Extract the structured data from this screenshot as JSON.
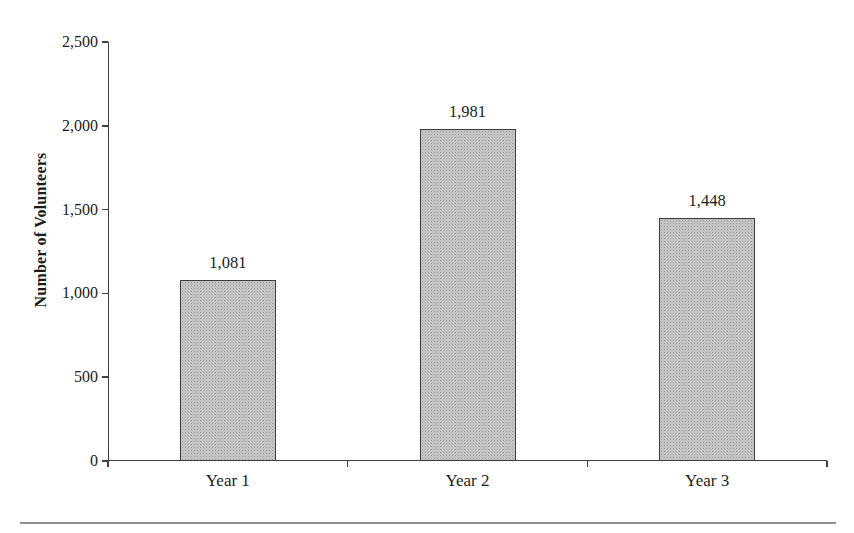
{
  "chart_data": {
    "type": "bar",
    "title": "",
    "categories": [
      "Year 1",
      "Year 2",
      "Year 3"
    ],
    "values": [
      1081,
      1981,
      1448
    ],
    "value_labels": [
      "1,081",
      "1,981",
      "1,448"
    ],
    "xlabel": "",
    "ylabel": "Number of Volunteers",
    "ylim": [
      0,
      2500
    ],
    "ytick_step": 500,
    "ytick_values": [
      0,
      500,
      1000,
      1500,
      2000,
      2500
    ],
    "ytick_labels": [
      "0",
      "500",
      "1,000",
      "1,500",
      "2,000",
      "2,500"
    ],
    "grid": false,
    "legend": false,
    "bar_fill_color": "#c6c6c6",
    "bar_dot_color": "#9a9a9a",
    "bar_border_color": "#3d3d3d",
    "axis_color": "#404040",
    "text_color": "#1c1c1c",
    "footer_rule_color": "#909090"
  }
}
